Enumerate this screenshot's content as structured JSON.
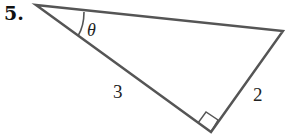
{
  "problem": {
    "number": "5."
  },
  "diagram": {
    "type": "right-triangle",
    "stroke_color": "#555555",
    "angle_label": "θ",
    "hypotenuse_label": "3",
    "side_label": "2",
    "right_angle_marker": true
  }
}
